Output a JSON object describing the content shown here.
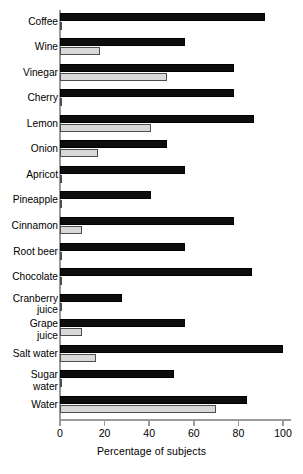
{
  "chart_data": {
    "type": "bar",
    "orientation": "horizontal",
    "title": "",
    "xlabel": "Percentage of subjects",
    "ylabel": "",
    "xlim": [
      0,
      100
    ],
    "xticks": [
      0,
      20,
      40,
      60,
      80,
      100
    ],
    "xtick_labels": [
      "0",
      "20",
      "40",
      "60",
      "80",
      "100"
    ],
    "grid": false,
    "legend": "none",
    "colors": {
      "series_dark": "#0d0d0d",
      "series_light": "#d9d9d9",
      "axis": "#9a9a9a",
      "background": "#ffffff"
    },
    "categories": [
      "Coffee",
      "Wine",
      "Vinegar",
      "Cherry",
      "Lemon",
      "Onion",
      "Apricot",
      "Pineapple",
      "Cinnamon",
      "Root beer",
      "Chocolate",
      "Cranberry\njuice",
      "Grape\njuice",
      "Salt water",
      "Sugar\nwater",
      "Water"
    ],
    "series": [
      {
        "name": "dark",
        "values": [
          92,
          56,
          78,
          78,
          87,
          48,
          56,
          41,
          78,
          56,
          86,
          28,
          56,
          100,
          51,
          84
        ]
      },
      {
        "name": "light",
        "values": [
          1,
          18,
          48,
          1,
          41,
          17,
          1,
          1,
          10,
          1,
          1,
          1,
          10,
          16,
          0.5,
          70
        ]
      }
    ]
  }
}
